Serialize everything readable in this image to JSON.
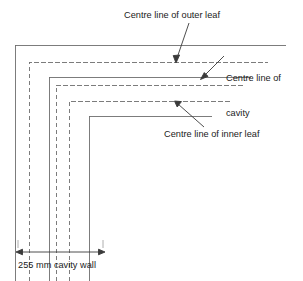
{
  "diagram": {
    "stroke_color": "#6e6e6e",
    "text_color": "#1a1a1a",
    "background": "#ffffff",
    "labels": {
      "outer_leaf": "Centre line of outer leaf",
      "cavity_line1": "Centre line of",
      "cavity_line2": "cavity",
      "inner_leaf": "Centre line of inner leaf",
      "dimension": "255 mm cavity wall"
    },
    "leaders": [
      {
        "name": "outer-leaf-leader",
        "from": [
          189,
          23
        ],
        "to": [
          176,
          62
        ]
      },
      {
        "name": "cavity-leader",
        "from": [
          224,
          56
        ],
        "to": [
          201,
          79
        ]
      },
      {
        "name": "inner-leaf-leader",
        "from": [
          204,
          127
        ],
        "to": [
          175,
          101
        ]
      }
    ],
    "wall_lines": [
      {
        "name": "outer-face",
        "style": "solid",
        "x": 15,
        "y": 45
      },
      {
        "name": "outer-leaf-centre",
        "style": "dashed",
        "x": 29,
        "y": 62
      },
      {
        "name": "cavity-outer-face",
        "style": "solid",
        "x": 49,
        "y": 77
      },
      {
        "name": "cavity-centre",
        "style": "dashed",
        "x": 56,
        "y": 85
      },
      {
        "name": "inner-leaf-centre",
        "style": "dashed",
        "x": 69,
        "y": 101
      },
      {
        "name": "inner-face",
        "style": "solid",
        "x": 89,
        "y": 116
      }
    ],
    "dimension": {
      "name": "overall-wall-width",
      "y": 252,
      "x_start": 18,
      "x_end": 103,
      "value": "255 mm cavity wall"
    }
  }
}
